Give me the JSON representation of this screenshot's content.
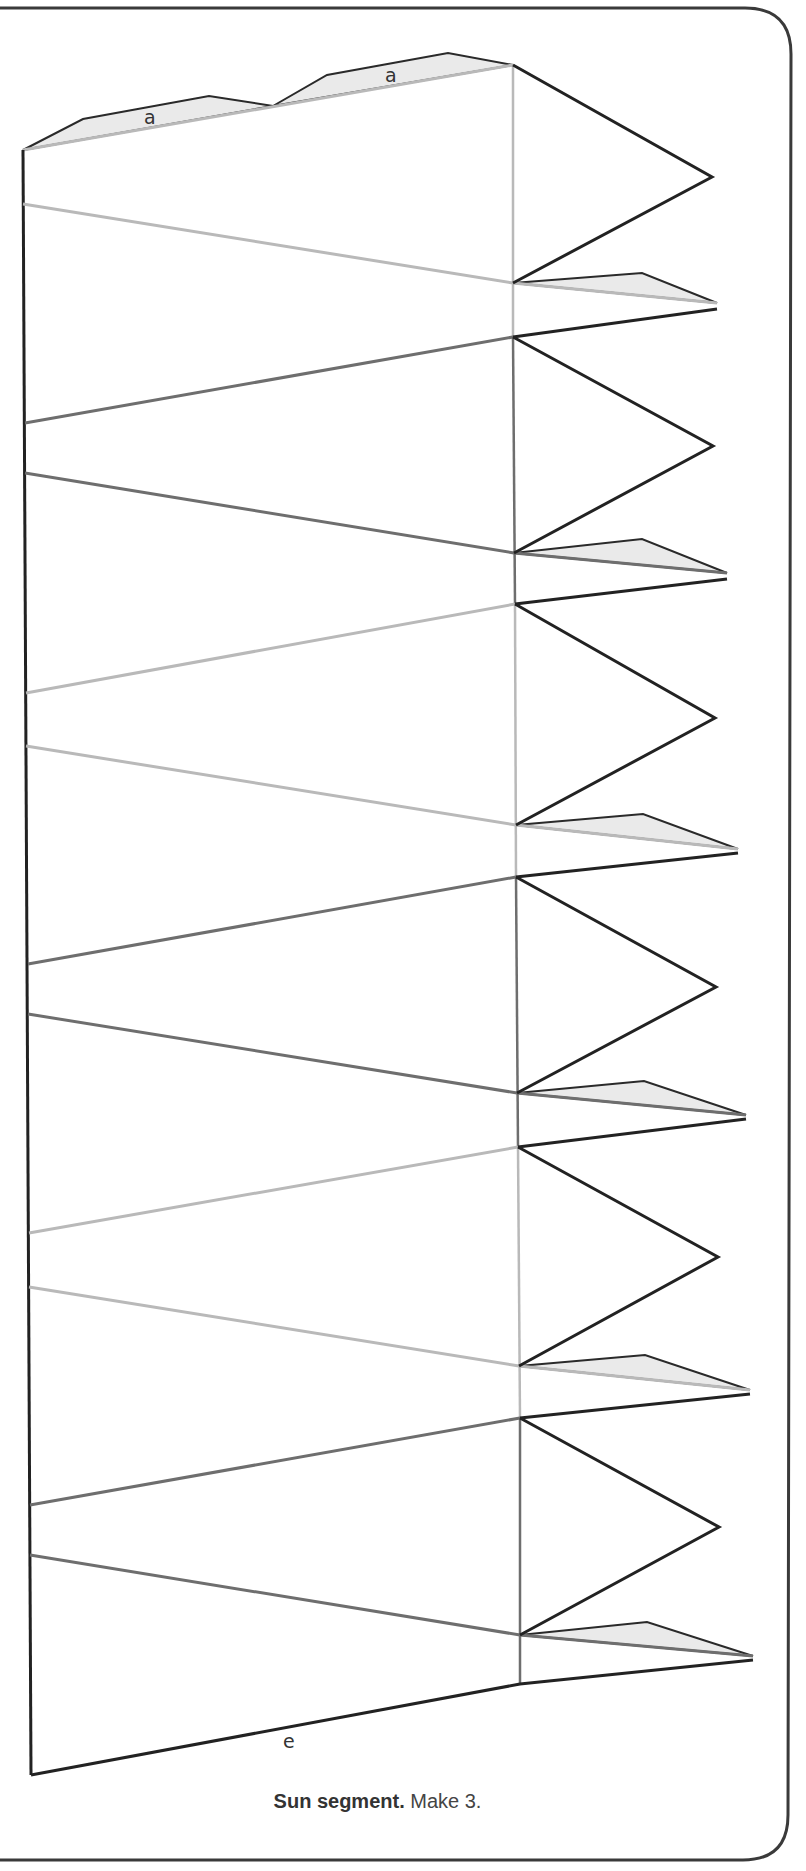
{
  "title": "Sun segment",
  "caption": {
    "bold": "Sun segment.",
    "rest": " Make 3."
  },
  "labels": {
    "tab_top_1": "a",
    "tab_top_2": "a",
    "bottom_edge": "e"
  },
  "colors": {
    "cut_line": "#222222",
    "fold_light": "#b9b9b9",
    "fold_dark": "#6e6e6e",
    "glue_tab_fill": "#eaeaea",
    "frame": "#3a3a3a"
  },
  "diagram": {
    "type": "papercraft-template",
    "segments": 6,
    "spikes": 6,
    "glue_tabs": 8,
    "legend": "Dark lines = cut, grey lines = fold, shaded = glue tabs"
  }
}
